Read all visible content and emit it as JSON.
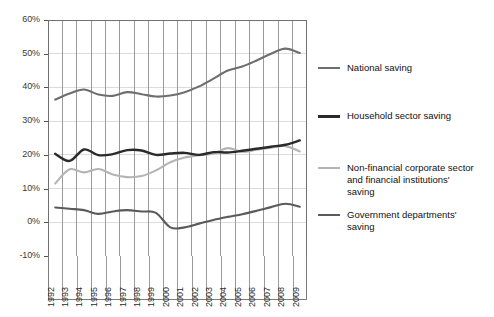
{
  "chart_data": {
    "type": "line",
    "title": "",
    "subtitle": "",
    "xlabel": "",
    "ylabel": "",
    "grid": "both",
    "legend_position": "right",
    "xlim": [
      1992,
      2009
    ],
    "ylim": [
      -10,
      60
    ],
    "y_tick_labels": [
      "60%",
      "50%",
      "40%",
      "30%",
      "20%",
      "10%",
      "0%",
      "-10%"
    ],
    "y_ticks": [
      60,
      50,
      40,
      30,
      20,
      10,
      0,
      -10
    ],
    "categories": [
      1992,
      1993,
      1994,
      1995,
      1996,
      1997,
      1998,
      1999,
      2000,
      2001,
      2002,
      2003,
      2004,
      2005,
      2006,
      2007,
      2008,
      2009
    ],
    "x_tick_labels": [
      "1992",
      "1993",
      "1994",
      "1995",
      "1996",
      "1997",
      "1998",
      "1999",
      "2000",
      "2001",
      "2002",
      "2003",
      "2004",
      "2005",
      "2006",
      "2007",
      "2008",
      "2009"
    ],
    "series": [
      {
        "name": "National saving",
        "color": "#6e6e6e",
        "width": 2.1,
        "values": [
          36.4,
          38.2,
          39.4,
          37.9,
          37.5,
          38.6,
          38.0,
          37.3,
          37.6,
          38.6,
          40.3,
          42.6,
          45.0,
          46.2,
          48.0,
          50.0,
          51.5,
          50.2
        ]
      },
      {
        "name": "Household sector saving",
        "color": "#2a2a2a",
        "width": 2.4,
        "values": [
          20.3,
          18.2,
          21.6,
          19.9,
          20.2,
          21.4,
          21.3,
          20.0,
          20.4,
          20.6,
          20.0,
          20.8,
          20.7,
          21.2,
          21.8,
          22.4,
          23.0,
          24.3
        ]
      },
      {
        "name": "Non-financial corporate sector and financial institutions' saving",
        "color": "#b4b4b4",
        "width": 2.1,
        "values": [
          11.5,
          15.7,
          14.8,
          15.8,
          14.2,
          13.4,
          13.7,
          15.4,
          17.8,
          19.2,
          19.9,
          20.4,
          22.0,
          20.9,
          21.5,
          22.1,
          22.6,
          21.0
        ]
      },
      {
        "name": "Government departments' saving",
        "color": "#5a5a5a",
        "width": 2.1,
        "values": [
          4.4,
          4.0,
          3.6,
          2.5,
          3.2,
          3.6,
          3.2,
          2.8,
          -1.5,
          -1.5,
          -0.4,
          0.7,
          1.6,
          2.4,
          3.4,
          4.5,
          5.5,
          4.6
        ]
      }
    ]
  },
  "legend": {
    "items": [
      {
        "label": "National saving"
      },
      {
        "label": "Household sector saving"
      },
      {
        "label": "Non-financial corporate sector\nand financial institutions'\nsaving"
      },
      {
        "label": "Government departments'\nsaving"
      }
    ]
  },
  "colors": {
    "national": "#6e6e6e",
    "household": "#2a2a2a",
    "corporate": "#b4b4b4",
    "government": "#5a5a5a",
    "grid_vertical": "#9a9a9a",
    "grid_horizontal": "#dcdcdc",
    "axis": "#6f6f6f",
    "background": "#ffffff"
  }
}
